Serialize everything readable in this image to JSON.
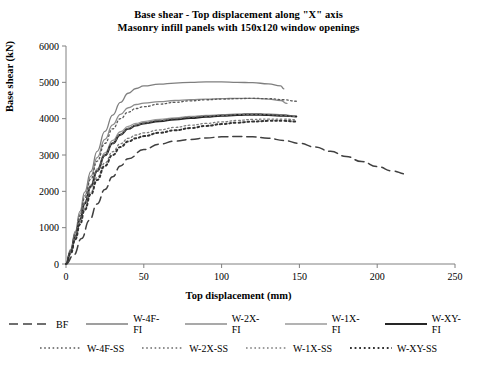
{
  "title": {
    "line1": "Base shear - Top displacement along \"X\" axis",
    "line2": "Masonry infill panels with 150x120 window openings"
  },
  "axes": {
    "xlabel": "Top displacement (mm)",
    "ylabel": "Base shear (kN)",
    "xticks": [
      "0",
      "50",
      "100",
      "150",
      "200",
      "250"
    ],
    "yticks": [
      "0",
      "1000",
      "2000",
      "3000",
      "4000",
      "5000",
      "6000"
    ]
  },
  "legend": {
    "row1": [
      {
        "label": "BF",
        "style": "dashed",
        "color": "#404040"
      },
      {
        "label": "W-4F-FI",
        "style": "solid",
        "color": "#7f7f7f"
      },
      {
        "label": "W-2X-FI",
        "style": "solid",
        "color": "#8c8c8c"
      },
      {
        "label": "W-1X-FI",
        "style": "solid",
        "color": "#9a9a9a"
      },
      {
        "label": "W-XY-FI",
        "style": "solid-thick",
        "color": "#262626"
      }
    ],
    "row2": [
      {
        "label": "W-4F-SS",
        "style": "dotted",
        "color": "#595959"
      },
      {
        "label": "W-2X-SS",
        "style": "dotted",
        "color": "#6b6b6b"
      },
      {
        "label": "W-1X-SS",
        "style": "dotted",
        "color": "#7d7d7d"
      },
      {
        "label": "W-XY-SS",
        "style": "dotted-thick",
        "color": "#333333"
      }
    ]
  },
  "chart_data": {
    "type": "line",
    "xlabel": "Top displacement (mm)",
    "ylabel": "Base shear (kN)",
    "xlim": [
      0,
      250
    ],
    "ylim": [
      0,
      6000
    ],
    "grid": false,
    "legend_position": "bottom",
    "series": [
      {
        "name": "BF",
        "style": "dashed",
        "color": "#404040",
        "points": [
          [
            0,
            0
          ],
          [
            5,
            250
          ],
          [
            10,
            700
          ],
          [
            15,
            1200
          ],
          [
            20,
            1650
          ],
          [
            25,
            2050
          ],
          [
            30,
            2400
          ],
          [
            35,
            2700
          ],
          [
            40,
            2900
          ],
          [
            50,
            3150
          ],
          [
            60,
            3300
          ],
          [
            70,
            3380
          ],
          [
            80,
            3430
          ],
          [
            90,
            3470
          ],
          [
            100,
            3500
          ],
          [
            110,
            3510
          ],
          [
            120,
            3500
          ],
          [
            130,
            3460
          ],
          [
            140,
            3400
          ],
          [
            150,
            3320
          ],
          [
            160,
            3220
          ],
          [
            170,
            3100
          ],
          [
            180,
            2960
          ],
          [
            190,
            2820
          ],
          [
            200,
            2680
          ],
          [
            210,
            2560
          ],
          [
            218,
            2480
          ]
        ]
      },
      {
        "name": "W-4F-FI",
        "style": "solid",
        "color": "#7f7f7f",
        "points": [
          [
            0,
            0
          ],
          [
            3,
            400
          ],
          [
            6,
            900
          ],
          [
            9,
            1450
          ],
          [
            12,
            1980
          ],
          [
            16,
            2550
          ],
          [
            20,
            3100
          ],
          [
            25,
            3650
          ],
          [
            30,
            4100
          ],
          [
            35,
            4450
          ],
          [
            40,
            4700
          ],
          [
            45,
            4830
          ],
          [
            50,
            4900
          ],
          [
            60,
            4950
          ],
          [
            70,
            4980
          ],
          [
            80,
            5000
          ],
          [
            90,
            5010
          ],
          [
            100,
            5010
          ],
          [
            110,
            5000
          ],
          [
            120,
            4990
          ],
          [
            130,
            4960
          ],
          [
            138,
            4900
          ],
          [
            140,
            4820
          ]
        ]
      },
      {
        "name": "W-2X-FI",
        "style": "solid",
        "color": "#8c8c8c",
        "points": [
          [
            0,
            0
          ],
          [
            3,
            380
          ],
          [
            6,
            860
          ],
          [
            9,
            1380
          ],
          [
            12,
            1880
          ],
          [
            16,
            2420
          ],
          [
            20,
            2930
          ],
          [
            25,
            3430
          ],
          [
            30,
            3830
          ],
          [
            35,
            4120
          ],
          [
            40,
            4300
          ],
          [
            45,
            4390
          ],
          [
            50,
            4430
          ],
          [
            60,
            4470
          ],
          [
            70,
            4500
          ],
          [
            80,
            4520
          ],
          [
            90,
            4540
          ],
          [
            100,
            4550
          ],
          [
            110,
            4560
          ],
          [
            120,
            4560
          ],
          [
            130,
            4540
          ],
          [
            138,
            4500
          ],
          [
            142,
            4420
          ]
        ]
      },
      {
        "name": "W-1X-FI",
        "style": "solid",
        "color": "#9a9a9a",
        "points": [
          [
            0,
            0
          ],
          [
            3,
            340
          ],
          [
            6,
            780
          ],
          [
            9,
            1250
          ],
          [
            12,
            1700
          ],
          [
            16,
            2180
          ],
          [
            20,
            2620
          ],
          [
            25,
            3060
          ],
          [
            30,
            3400
          ],
          [
            35,
            3640
          ],
          [
            40,
            3790
          ],
          [
            45,
            3870
          ],
          [
            50,
            3920
          ],
          [
            60,
            3980
          ],
          [
            70,
            4020
          ],
          [
            80,
            4060
          ],
          [
            90,
            4090
          ],
          [
            100,
            4110
          ],
          [
            110,
            4130
          ],
          [
            120,
            4140
          ],
          [
            130,
            4130
          ],
          [
            140,
            4110
          ],
          [
            148,
            4060
          ]
        ]
      },
      {
        "name": "W-XY-FI",
        "style": "solid-thick",
        "color": "#262626",
        "points": [
          [
            0,
            0
          ],
          [
            3,
            330
          ],
          [
            6,
            760
          ],
          [
            9,
            1220
          ],
          [
            12,
            1660
          ],
          [
            16,
            2130
          ],
          [
            20,
            2560
          ],
          [
            25,
            2990
          ],
          [
            30,
            3320
          ],
          [
            35,
            3560
          ],
          [
            40,
            3720
          ],
          [
            45,
            3810
          ],
          [
            50,
            3870
          ],
          [
            60,
            3930
          ],
          [
            70,
            3980
          ],
          [
            80,
            4020
          ],
          [
            90,
            4050
          ],
          [
            100,
            4080
          ],
          [
            110,
            4100
          ],
          [
            120,
            4110
          ],
          [
            130,
            4100
          ],
          [
            140,
            4080
          ],
          [
            148,
            4060
          ]
        ]
      },
      {
        "name": "W-4F-SS",
        "style": "dotted",
        "color": "#595959",
        "points": [
          [
            0,
            0
          ],
          [
            3,
            360
          ],
          [
            6,
            830
          ],
          [
            9,
            1330
          ],
          [
            12,
            1820
          ],
          [
            16,
            2340
          ],
          [
            20,
            2830
          ],
          [
            25,
            3320
          ],
          [
            30,
            3720
          ],
          [
            35,
            4000
          ],
          [
            40,
            4180
          ],
          [
            45,
            4280
          ],
          [
            50,
            4330
          ],
          [
            60,
            4400
          ],
          [
            70,
            4450
          ],
          [
            80,
            4490
          ],
          [
            90,
            4520
          ],
          [
            100,
            4540
          ],
          [
            110,
            4550
          ],
          [
            120,
            4560
          ],
          [
            130,
            4550
          ],
          [
            140,
            4520
          ],
          [
            148,
            4480
          ]
        ]
      },
      {
        "name": "W-2X-SS",
        "style": "dotted",
        "color": "#6b6b6b",
        "points": [
          [
            0,
            0
          ],
          [
            3,
            330
          ],
          [
            6,
            760
          ],
          [
            9,
            1220
          ],
          [
            12,
            1660
          ],
          [
            16,
            2130
          ],
          [
            20,
            2560
          ],
          [
            25,
            2990
          ],
          [
            30,
            3330
          ],
          [
            35,
            3570
          ],
          [
            40,
            3730
          ],
          [
            45,
            3820
          ],
          [
            50,
            3880
          ],
          [
            60,
            3950
          ],
          [
            70,
            4000
          ],
          [
            80,
            4040
          ],
          [
            90,
            4070
          ],
          [
            100,
            4090
          ],
          [
            110,
            4110
          ],
          [
            120,
            4120
          ],
          [
            130,
            4110
          ],
          [
            140,
            4090
          ],
          [
            148,
            4060
          ]
        ]
      },
      {
        "name": "W-1X-SS",
        "style": "dotted",
        "color": "#7d7d7d",
        "points": [
          [
            0,
            0
          ],
          [
            3,
            300
          ],
          [
            6,
            700
          ],
          [
            9,
            1130
          ],
          [
            12,
            1540
          ],
          [
            16,
            1980
          ],
          [
            20,
            2380
          ],
          [
            25,
            2780
          ],
          [
            30,
            3090
          ],
          [
            35,
            3310
          ],
          [
            40,
            3460
          ],
          [
            45,
            3550
          ],
          [
            50,
            3610
          ],
          [
            60,
            3690
          ],
          [
            70,
            3760
          ],
          [
            80,
            3820
          ],
          [
            90,
            3870
          ],
          [
            100,
            3910
          ],
          [
            110,
            3950
          ],
          [
            120,
            3980
          ],
          [
            130,
            3990
          ],
          [
            140,
            3990
          ],
          [
            148,
            3970
          ]
        ]
      },
      {
        "name": "W-XY-SS",
        "style": "dotted-thick",
        "color": "#333333",
        "points": [
          [
            0,
            0
          ],
          [
            3,
            290
          ],
          [
            6,
            680
          ],
          [
            9,
            1090
          ],
          [
            12,
            1490
          ],
          [
            16,
            1920
          ],
          [
            20,
            2310
          ],
          [
            25,
            2700
          ],
          [
            30,
            3000
          ],
          [
            35,
            3220
          ],
          [
            40,
            3370
          ],
          [
            45,
            3460
          ],
          [
            50,
            3520
          ],
          [
            60,
            3610
          ],
          [
            70,
            3680
          ],
          [
            80,
            3740
          ],
          [
            90,
            3800
          ],
          [
            100,
            3850
          ],
          [
            110,
            3890
          ],
          [
            120,
            3920
          ],
          [
            130,
            3940
          ],
          [
            140,
            3940
          ],
          [
            148,
            3920
          ]
        ]
      }
    ]
  }
}
